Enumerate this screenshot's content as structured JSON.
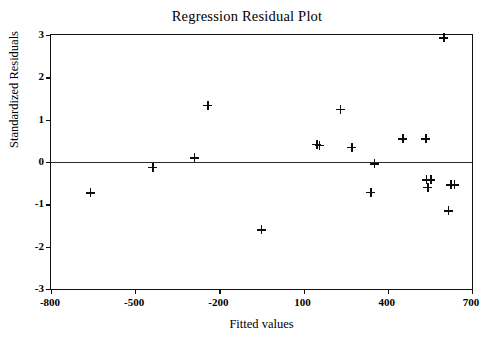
{
  "chart_data": {
    "type": "scatter",
    "title": "Regression Residual Plot",
    "xlabel": "Fitted values",
    "ylabel": "Standardized Residuals",
    "xlim": [
      -800,
      700
    ],
    "ylim": [
      -3,
      3
    ],
    "xticks": [
      -800,
      -500,
      -200,
      100,
      400,
      700
    ],
    "xtick_labels": [
      "-800",
      "-500",
      "-200",
      "100",
      "400",
      "700"
    ],
    "yticks": [
      3,
      2,
      1,
      0,
      -1,
      -2,
      -3
    ],
    "ytick_labels": [
      "3",
      "2",
      "1",
      "0",
      "-1",
      "-2",
      "-3"
    ],
    "grid": false,
    "legend": null,
    "marker": "plus",
    "marker_color": "#0d0d0d",
    "reference_line": {
      "type": "horizontal",
      "y": 0,
      "color": "#2a2a2a"
    },
    "series": [
      {
        "name": "residuals",
        "points": [
          {
            "x": -660,
            "y": -0.73
          },
          {
            "x": -437,
            "y": -0.12
          },
          {
            "x": -289,
            "y": 0.1
          },
          {
            "x": -241,
            "y": 1.34
          },
          {
            "x": -50,
            "y": -1.6
          },
          {
            "x": 147,
            "y": 0.42
          },
          {
            "x": 155,
            "y": 0.4
          },
          {
            "x": 230,
            "y": 1.24
          },
          {
            "x": 272,
            "y": 0.35
          },
          {
            "x": 351,
            "y": -0.04
          },
          {
            "x": 340,
            "y": -0.72
          },
          {
            "x": 453,
            "y": 0.55
          },
          {
            "x": 536,
            "y": 0.55
          },
          {
            "x": 538,
            "y": -0.42
          },
          {
            "x": 553,
            "y": -0.42
          },
          {
            "x": 542,
            "y": -0.6
          },
          {
            "x": 625,
            "y": -0.54
          },
          {
            "x": 636,
            "y": -0.54
          },
          {
            "x": 615,
            "y": -1.15
          },
          {
            "x": 600,
            "y": 2.93
          }
        ]
      }
    ]
  }
}
